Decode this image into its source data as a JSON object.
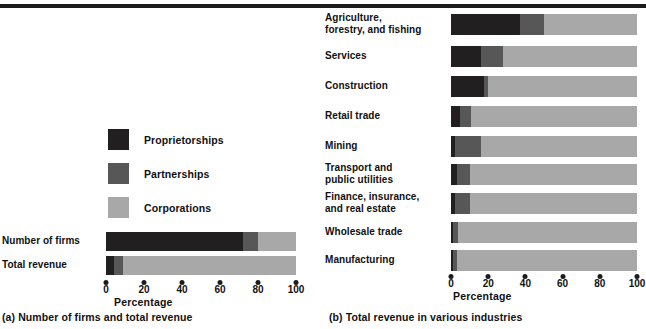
{
  "colors": {
    "proprietorships": "#211f1f",
    "partnerships": "#575757",
    "corporations": "#a8a8a8",
    "rule": "#1c1c1c",
    "text": "#111111"
  },
  "legend": {
    "items": [
      {
        "label": "Proprietorships",
        "color_key": "proprietorships"
      },
      {
        "label": "Partnerships",
        "color_key": "partnerships"
      },
      {
        "label": "Corporations",
        "color_key": "corporations"
      }
    ]
  },
  "panel_a": {
    "caption": "(a) Number of firms and total revenue",
    "axis_title": "Percentage",
    "ticks": [
      "0",
      "20",
      "40",
      "60",
      "80",
      "100"
    ]
  },
  "panel_b": {
    "caption": "(b) Total revenue in various industries",
    "axis_title": "Percentage",
    "ticks": [
      "0",
      "20",
      "40",
      "60",
      "80",
      "100"
    ]
  },
  "chart_data": [
    {
      "type": "bar",
      "orientation": "horizontal",
      "stacked": true,
      "title": "(a) Number of firms and total revenue",
      "xlabel": "Percentage",
      "ylabel": "",
      "xlim": [
        0,
        100
      ],
      "xticks": [
        0,
        20,
        40,
        60,
        80,
        100
      ],
      "grid": false,
      "legend": [
        "Proprietorships",
        "Partnerships",
        "Corporations"
      ],
      "legend_position": "upper-center",
      "categories": [
        "Number of firms",
        "Total revenue"
      ],
      "series": [
        {
          "name": "Proprietorships",
          "color": "#211f1f",
          "values": [
            72,
            4
          ]
        },
        {
          "name": "Partnerships",
          "color": "#575757",
          "values": [
            8,
            5
          ]
        },
        {
          "name": "Corporations",
          "color": "#a8a8a8",
          "values": [
            20,
            91
          ]
        }
      ]
    },
    {
      "type": "bar",
      "orientation": "horizontal",
      "stacked": true,
      "title": "(b) Total revenue in various industries",
      "xlabel": "Percentage",
      "ylabel": "",
      "xlim": [
        0,
        100
      ],
      "xticks": [
        0,
        20,
        40,
        60,
        80,
        100
      ],
      "grid": false,
      "legend": [
        "Proprietorships",
        "Partnerships",
        "Corporations"
      ],
      "categories": [
        "Agriculture,\nforestry, and fishing",
        "Services",
        "Construction",
        "Retail trade",
        "Mining",
        "Transport and\npublic utilities",
        "Finance, insurance,\nand real estate",
        "Wholesale trade",
        "Manufacturing"
      ],
      "series": [
        {
          "name": "Proprietorships",
          "color": "#211f1f",
          "values": [
            37,
            16,
            18,
            5,
            2,
            3,
            2,
            1,
            1
          ]
        },
        {
          "name": "Partnerships",
          "color": "#575757",
          "values": [
            13,
            12,
            2,
            6,
            14,
            7,
            8,
            3,
            2
          ]
        },
        {
          "name": "Corporations",
          "color": "#a8a8a8",
          "values": [
            50,
            72,
            80,
            89,
            84,
            90,
            90,
            96,
            97
          ]
        }
      ]
    }
  ]
}
